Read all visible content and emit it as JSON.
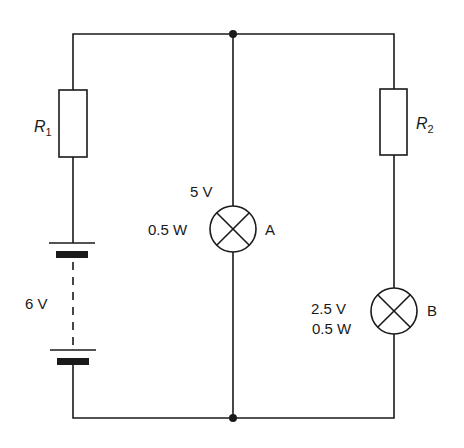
{
  "diagram": {
    "type": "circuit",
    "battery": {
      "label": "6 V"
    },
    "resistors": [
      {
        "name": "R",
        "subscript": "1"
      },
      {
        "name": "R",
        "subscript": "2"
      }
    ],
    "lamps": [
      {
        "id": "A",
        "voltage": "5 V",
        "power": "0.5 W"
      },
      {
        "id": "B",
        "voltage": "2.5 V",
        "power": "0.5 W"
      }
    ],
    "colors": {
      "line": "#1a1a1a",
      "background": "#ffffff"
    }
  }
}
